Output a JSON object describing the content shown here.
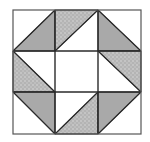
{
  "diagram": {
    "title": "",
    "type": "quilt-block",
    "grid": {
      "rows": 3,
      "cols": 3
    },
    "colors": {
      "background": "#ffffff",
      "outline": "#2a2a2a",
      "solid_gray": "#a9a9a9",
      "speckled_base": "#b4b4b4",
      "speckled_dot": "#d6d6d6",
      "light": "#ffffff"
    },
    "cells": [
      {
        "row": 0,
        "col": 0,
        "diagonal": "bl-tr",
        "filled_half": "lower-right",
        "fill": "solid_gray"
      },
      {
        "row": 0,
        "col": 1,
        "diagonal": "bl-tr",
        "filled_half": "upper-left",
        "fill": "speckled"
      },
      {
        "row": 0,
        "col": 2,
        "diagonal": "tl-br",
        "filled_half": "lower-left",
        "fill": "solid_gray"
      },
      {
        "row": 1,
        "col": 0,
        "diagonal": "tl-br",
        "filled_half": "lower-left",
        "fill": "speckled"
      },
      {
        "row": 1,
        "col": 1,
        "diagonal": "none",
        "filled_half": "none",
        "fill": "light"
      },
      {
        "row": 1,
        "col": 2,
        "diagonal": "tl-br",
        "filled_half": "upper-right",
        "fill": "speckled"
      },
      {
        "row": 2,
        "col": 0,
        "diagonal": "tl-br",
        "filled_half": "upper-right",
        "fill": "solid_gray"
      },
      {
        "row": 2,
        "col": 1,
        "diagonal": "bl-tr",
        "filled_half": "lower-right",
        "fill": "speckled"
      },
      {
        "row": 2,
        "col": 2,
        "diagonal": "bl-tr",
        "filled_half": "upper-left",
        "fill": "solid_gray"
      }
    ]
  }
}
